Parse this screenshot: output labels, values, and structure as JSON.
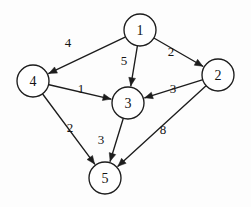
{
  "figure": {
    "type": "directed-weighted-graph",
    "background_color": "#fdfdfd",
    "stroke_color": "#1c1c1c",
    "node_fill": "#ffffff",
    "width": 251,
    "height": 207
  },
  "chart_data": {
    "type": "diagram",
    "title": "",
    "graph_type": "directed weighted graph",
    "nodes": [
      {
        "id": "1",
        "label": "1",
        "x": 140,
        "y": 30,
        "r": 16
      },
      {
        "id": "2",
        "label": "2",
        "x": 218,
        "y": 75,
        "r": 16
      },
      {
        "id": "3",
        "label": "3",
        "x": 128,
        "y": 103,
        "r": 16
      },
      {
        "id": "4",
        "label": "4",
        "x": 33,
        "y": 81,
        "r": 16
      },
      {
        "id": "5",
        "label": "5",
        "x": 105,
        "y": 178,
        "r": 16
      }
    ],
    "edges": [
      {
        "from": "1",
        "to": "4",
        "weight": "4",
        "label_x": 68,
        "label_y": 42,
        "x1": 140,
        "y1": 30,
        "x2": 33,
        "y2": 81
      },
      {
        "from": "1",
        "to": "2",
        "weight": "2",
        "label_x": 171,
        "label_y": 51,
        "x1": 140,
        "y1": 30,
        "x2": 218,
        "y2": 75
      },
      {
        "from": "1",
        "to": "3",
        "weight": "5",
        "label_x": 124,
        "label_y": 60,
        "x1": 140,
        "y1": 30,
        "x2": 128,
        "y2": 103
      },
      {
        "from": "4",
        "to": "3",
        "weight": "1",
        "label_x": 81,
        "label_y": 88,
        "x1": 33,
        "y1": 81,
        "x2": 128,
        "y2": 103
      },
      {
        "from": "2",
        "to": "3",
        "weight": "3",
        "label_x": 173,
        "label_y": 88,
        "x1": 218,
        "y1": 75,
        "x2": 128,
        "y2": 103
      },
      {
        "from": "4",
        "to": "5",
        "weight": "2",
        "label_x": 70,
        "label_y": 127,
        "x1": 33,
        "y1": 81,
        "x2": 105,
        "y2": 178
      },
      {
        "from": "3",
        "to": "5",
        "weight": "3",
        "label_x": 101,
        "label_y": 139,
        "x1": 128,
        "y1": 103,
        "x2": 105,
        "y2": 178
      },
      {
        "from": "2",
        "to": "5",
        "weight": "8",
        "label_x": 163,
        "label_y": 129,
        "x1": 218,
        "y1": 75,
        "x2": 105,
        "y2": 178
      }
    ],
    "node_count": 5,
    "edge_count": 8,
    "weights": [
      "4",
      "2",
      "5",
      "1",
      "3",
      "2",
      "3",
      "8"
    ]
  }
}
